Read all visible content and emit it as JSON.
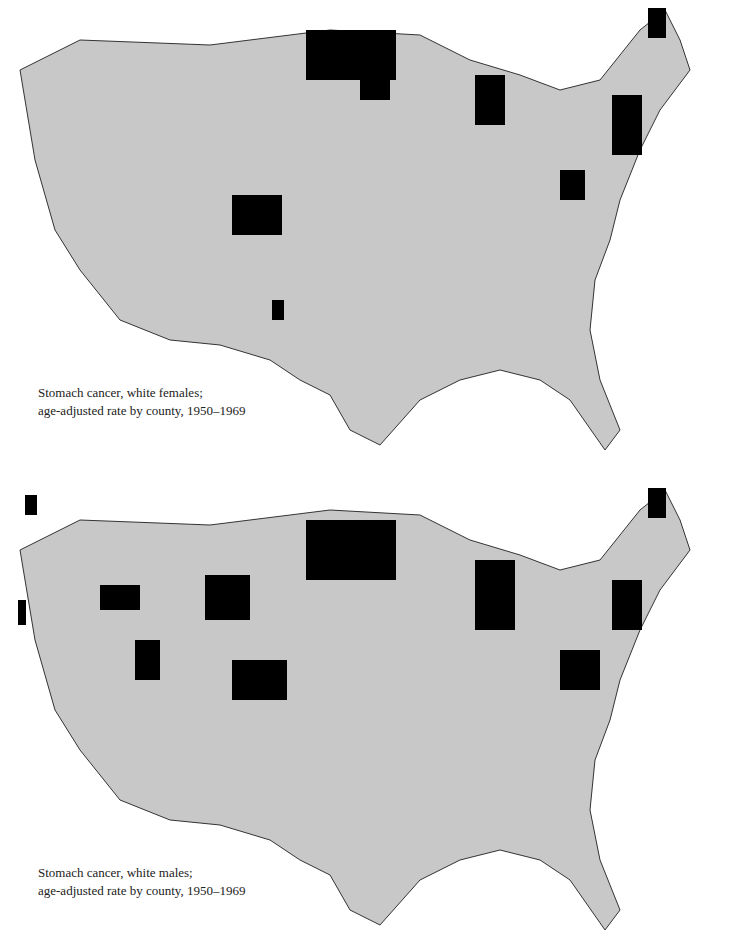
{
  "maps": [
    {
      "caption_line1": "Stomach cancer, white females;",
      "caption_line2": "age-adjusted rate by county, 1950–1969",
      "high_clusters": [
        {
          "x": 232,
          "y": 195,
          "w": 50,
          "h": 40
        },
        {
          "x": 306,
          "y": 30,
          "w": 90,
          "h": 50
        },
        {
          "x": 475,
          "y": 75,
          "w": 30,
          "h": 50
        },
        {
          "x": 648,
          "y": 8,
          "w": 18,
          "h": 30
        },
        {
          "x": 612,
          "y": 95,
          "w": 30,
          "h": 60
        },
        {
          "x": 560,
          "y": 170,
          "w": 25,
          "h": 30
        },
        {
          "x": 272,
          "y": 300,
          "w": 12,
          "h": 20
        },
        {
          "x": 360,
          "y": 40,
          "w": 30,
          "h": 60
        }
      ]
    },
    {
      "caption_line1": "Stomach cancer, white males;",
      "caption_line2": "age-adjusted rate by county, 1950–1969",
      "high_clusters": [
        {
          "x": 232,
          "y": 660,
          "w": 55,
          "h": 40
        },
        {
          "x": 306,
          "y": 520,
          "w": 90,
          "h": 60
        },
        {
          "x": 475,
          "y": 560,
          "w": 40,
          "h": 70
        },
        {
          "x": 648,
          "y": 488,
          "w": 18,
          "h": 30
        },
        {
          "x": 612,
          "y": 580,
          "w": 30,
          "h": 50
        },
        {
          "x": 560,
          "y": 650,
          "w": 40,
          "h": 40
        },
        {
          "x": 205,
          "y": 575,
          "w": 45,
          "h": 45
        },
        {
          "x": 135,
          "y": 640,
          "w": 25,
          "h": 40
        },
        {
          "x": 18,
          "y": 600,
          "w": 8,
          "h": 25
        },
        {
          "x": 100,
          "y": 585,
          "w": 40,
          "h": 25
        },
        {
          "x": 25,
          "y": 495,
          "w": 12,
          "h": 20
        }
      ]
    }
  ],
  "colors": {
    "none": "#ffffff",
    "low": "#c8c8c8",
    "mid": "#808080",
    "high": "#000000",
    "border": "#333333"
  }
}
